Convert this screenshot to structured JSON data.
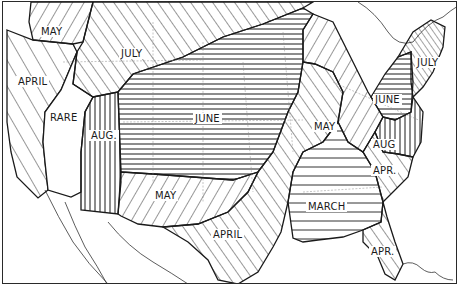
{
  "map": {
    "subject": "United States seasonal timing map with hatched regions by month",
    "colors": {
      "ink": "#1a1a1a",
      "background": "#ffffff",
      "state_lines": "#8a8a8a"
    },
    "regions": [
      {
        "id": "nw-may",
        "label": "MAY",
        "hatch": "diagonal-back"
      },
      {
        "id": "west-coast-april",
        "label": "APRIL",
        "hatch": "diagonal-forward-wide"
      },
      {
        "id": "great-basin-rare",
        "label": "RARE",
        "hatch": "none"
      },
      {
        "id": "northern-plains-july",
        "label": "JULY",
        "hatch": "diagonal-forward"
      },
      {
        "id": "rockies-aug",
        "label": "AUG.",
        "hatch": "vertical"
      },
      {
        "id": "central-june",
        "label": "JUNE",
        "hatch": "horizontal"
      },
      {
        "id": "southern-plains-may",
        "label": "MAY",
        "hatch": "diagonal-back"
      },
      {
        "id": "ohio-valley-may",
        "label": "MAY",
        "hatch": "diagonal-back"
      },
      {
        "id": "texas-april",
        "label": "APRIL",
        "hatch": "diagonal-forward"
      },
      {
        "id": "southeast-march",
        "label": "MARCH",
        "hatch": "horizontal-wide"
      },
      {
        "id": "new-england-july",
        "label": "JULY",
        "hatch": "diagonal-forward-fine"
      },
      {
        "id": "northeast-june",
        "label": "JUNE",
        "hatch": "horizontal"
      },
      {
        "id": "mid-atlantic-aug",
        "label": "AUG",
        "hatch": "vertical"
      },
      {
        "id": "carolinas-apr",
        "label": "APR.",
        "hatch": "diagonal-forward"
      },
      {
        "id": "florida-apr",
        "label": "APR.",
        "hatch": "diagonal-forward"
      }
    ]
  }
}
